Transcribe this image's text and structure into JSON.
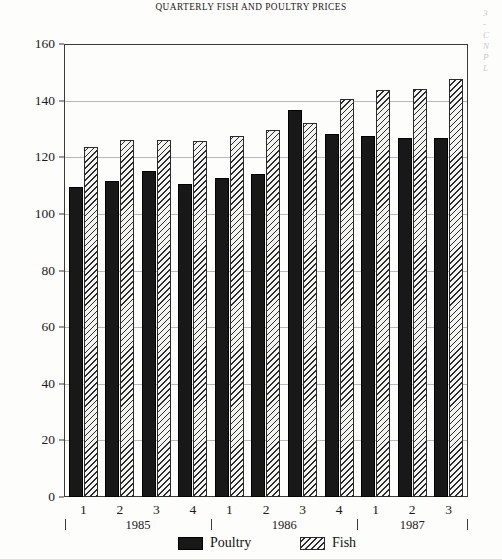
{
  "chart_data": {
    "type": "bar",
    "title": "QUARTERLY FISH AND POULTRY PRICES",
    "xlabel": "",
    "ylabel": "",
    "ylim": [
      0,
      160
    ],
    "yticks": [
      0,
      20,
      40,
      60,
      80,
      100,
      120,
      140,
      160
    ],
    "grid": true,
    "legend_position": "bottom",
    "categories": [
      "1",
      "2",
      "3",
      "4",
      "1",
      "2",
      "3",
      "4",
      "1",
      "2",
      "3"
    ],
    "group_labels": [
      "1985",
      "1985",
      "1985",
      "1985",
      "1986",
      "1986",
      "1986",
      "1986",
      "1987",
      "1987",
      "1987"
    ],
    "year_groups": [
      {
        "label": "1985",
        "quarters": [
          "1",
          "2",
          "3",
          "4"
        ]
      },
      {
        "label": "1986",
        "quarters": [
          "1",
          "2",
          "3",
          "4"
        ]
      },
      {
        "label": "1987",
        "quarters": [
          "1",
          "2",
          "3"
        ]
      }
    ],
    "series": [
      {
        "name": "Poultry",
        "color": "#181818",
        "fill": "solid",
        "values": [
          110,
          112,
          115.5,
          111,
          113,
          114.5,
          137,
          128.5,
          128,
          127,
          127
        ]
      },
      {
        "name": "Fish",
        "color": "#f4f4f2",
        "fill": "diagonal-hatch",
        "values": [
          124,
          126.5,
          126.5,
          126,
          128,
          130,
          132.5,
          141,
          144,
          144.5,
          148
        ]
      }
    ]
  },
  "legend": {
    "items": [
      {
        "label": "Poultry",
        "swatch": "solid-black"
      },
      {
        "label": "Fish",
        "swatch": "diagonal-hatch"
      }
    ]
  },
  "margin_note": {
    "lines": [
      "3",
      "-",
      "C",
      "N",
      "P",
      "L"
    ]
  }
}
